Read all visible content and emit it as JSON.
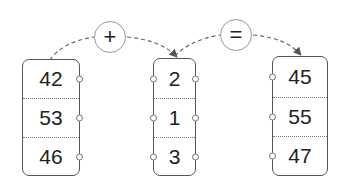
{
  "operators": {
    "plus": "+",
    "equals": "="
  },
  "columns": {
    "left": [
      "42",
      "53",
      "46"
    ],
    "middle": [
      "2",
      "1",
      "3"
    ],
    "result": [
      "45",
      "55",
      "47"
    ]
  },
  "colors": {
    "box_border": "#555555",
    "operator_border": "#9a9a9a",
    "dashed_arrow": "#555555",
    "text": "#222222"
  }
}
